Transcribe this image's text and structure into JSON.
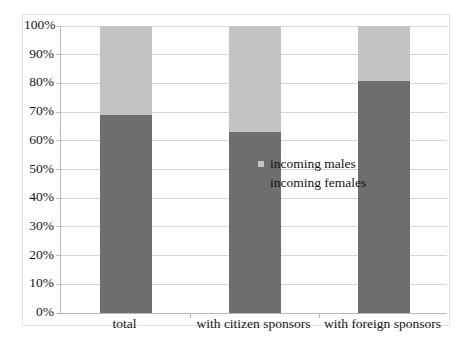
{
  "chart_data": {
    "type": "bar",
    "subtype": "stacked-percentage",
    "title": "",
    "xlabel": "",
    "ylabel": "",
    "categories": [
      "total",
      "with citizen sponsors",
      "with foreign sponsors"
    ],
    "series": [
      {
        "name": "incoming females",
        "color": "#6e6e6e",
        "values": [
          69,
          63,
          81
        ]
      },
      {
        "name": "incoming males",
        "color": "#c3c3c3",
        "values": [
          31,
          37,
          19
        ]
      }
    ],
    "stack_order": [
      "incoming females",
      "incoming males"
    ],
    "ylim": [
      0,
      100
    ],
    "ytick_step": 10,
    "ytick_labels": [
      "100%",
      "90%",
      "80%",
      "70%",
      "60%",
      "50%",
      "40%",
      "30%",
      "20%",
      "10%",
      "0%"
    ],
    "ytick_values": [
      100,
      90,
      80,
      70,
      60,
      50,
      40,
      30,
      20,
      10,
      0
    ],
    "grid": true,
    "grid_color": "#d6d6d6",
    "axis_color": "#b8b8b8",
    "legend_position": "inside-right-middle",
    "legend": [
      {
        "label": "incoming males",
        "color": "#c3c3c3"
      },
      {
        "label": "incoming females",
        "color": "#6e6e6e"
      }
    ],
    "background": "#ffffff"
  }
}
